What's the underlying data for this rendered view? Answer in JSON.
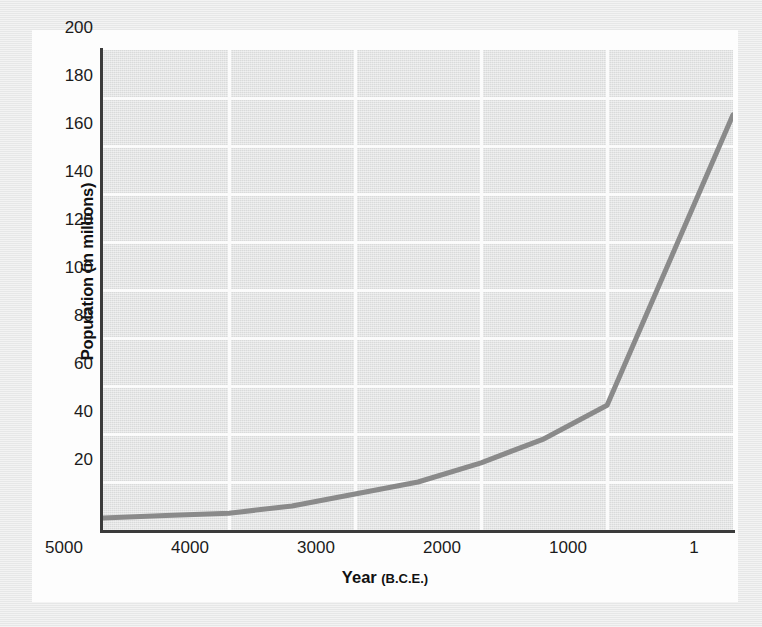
{
  "figure": {
    "background_color": "#e9eaea",
    "card_color": "#fdfdfd",
    "plot_background_color": "#e4e5e5",
    "gridline_color": "#fbfbfb",
    "axis_color": "#3b3b3b",
    "series_color": "#8a8a8a"
  },
  "chart_data": {
    "type": "line",
    "title": "",
    "subtitle": "",
    "xlabel": "Year (B.C.E.)",
    "xlabel_main": "Year",
    "xlabel_sub": "(B.C.E.)",
    "ylabel": "Population (in millions)",
    "xlim": [
      5000,
      1
    ],
    "ylim": [
      0,
      200
    ],
    "x_inverted": true,
    "grid": true,
    "grid_axes": "both",
    "legend": "none",
    "x_ticks": [
      "5000",
      "4000",
      "3000",
      "2000",
      "1000",
      "1"
    ],
    "x_tick_values": [
      5000,
      4000,
      3000,
      2000,
      1000,
      1
    ],
    "y_ticks": [
      "20",
      "40",
      "60",
      "80",
      "100",
      "120",
      "140",
      "160",
      "180",
      "200"
    ],
    "y_tick_values": [
      20,
      40,
      60,
      80,
      100,
      120,
      140,
      160,
      180,
      200
    ],
    "series": [
      {
        "name": "World population",
        "color": "#8a8a8a",
        "x": [
          5000,
          4500,
          4000,
          3500,
          3000,
          2500,
          2000,
          1500,
          1000,
          1
        ],
        "values": [
          5,
          6,
          7,
          10,
          15,
          20,
          28,
          38,
          52,
          173
        ]
      }
    ],
    "points": [
      {
        "x": 5000,
        "y": 5
      },
      {
        "x": 4500,
        "y": 6
      },
      {
        "x": 4000,
        "y": 7
      },
      {
        "x": 3500,
        "y": 10
      },
      {
        "x": 3000,
        "y": 15
      },
      {
        "x": 2500,
        "y": 20
      },
      {
        "x": 2000,
        "y": 28
      },
      {
        "x": 1500,
        "y": 38
      },
      {
        "x": 1000,
        "y": 52
      },
      {
        "x": 1,
        "y": 173
      }
    ],
    "annotations": []
  }
}
